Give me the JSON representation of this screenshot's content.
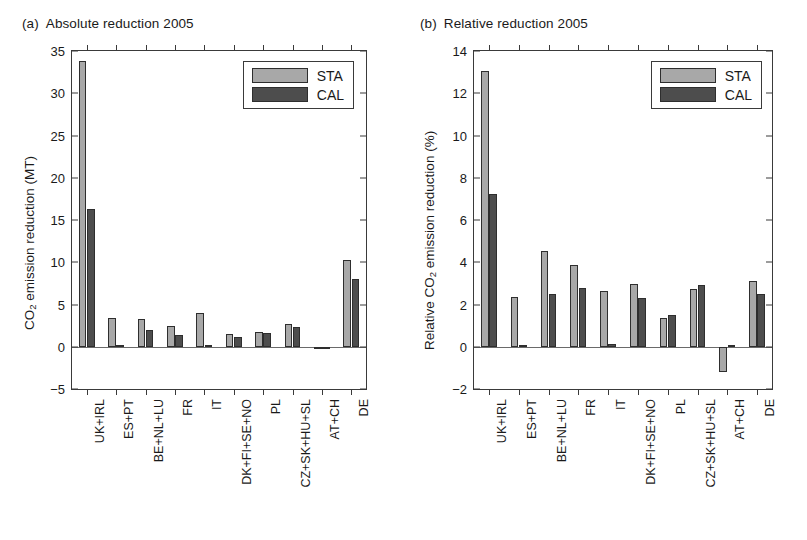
{
  "figure": {
    "panels": [
      {
        "tag": "(a)",
        "title": "Absolute reduction 2005",
        "ylabel_pre": "CO",
        "ylabel_sub": "2",
        "ylabel_post": " emission reduction (MT)",
        "legend": {
          "sta": "STA",
          "cal": "CAL"
        }
      },
      {
        "tag": "(b)",
        "title": "Relative reduction 2005",
        "ylabel_pre": "Relative CO",
        "ylabel_sub": "2",
        "ylabel_post": " emission reduction (%)",
        "legend": {
          "sta": "STA",
          "cal": "CAL"
        }
      }
    ]
  },
  "colors": {
    "sta": "#a8a8a8",
    "cal": "#4d4d4d",
    "axis": "#3a3a3a",
    "background": "#ffffff"
  },
  "chart_data": [
    {
      "type": "bar",
      "panel": "a",
      "title": "Absolute reduction 2005",
      "xlabel": "",
      "ylabel": "CO2 emission reduction (MT)",
      "ylim": [
        -5,
        35
      ],
      "yticks": [
        -5,
        0,
        5,
        10,
        15,
        20,
        25,
        30,
        35
      ],
      "grid": false,
      "legend_position": "top-right",
      "categories": [
        "UK+IRL",
        "ES+PT",
        "BE+NL+LU",
        "FR",
        "IT",
        "DK+FI+SE+NO",
        "PL",
        "CZ+SK+HU+SL",
        "AT+CH",
        "DE"
      ],
      "series": [
        {
          "name": "STA",
          "values": [
            33.8,
            3.4,
            3.3,
            2.4,
            4.0,
            1.5,
            1.7,
            2.7,
            -0.15,
            10.3
          ]
        },
        {
          "name": "CAL",
          "values": [
            16.3,
            0.15,
            2.0,
            1.4,
            0.2,
            1.2,
            1.6,
            2.3,
            -0.1,
            8.0
          ]
        }
      ]
    },
    {
      "type": "bar",
      "panel": "b",
      "title": "Relative reduction 2005",
      "xlabel": "",
      "ylabel": "Relative CO2 emission reduction (%)",
      "ylim": [
        -2,
        14
      ],
      "yticks": [
        -2,
        0,
        2,
        4,
        6,
        8,
        10,
        12,
        14
      ],
      "grid": false,
      "legend_position": "top-right",
      "categories": [
        "UK+IRL",
        "ES+PT",
        "BE+NL+LU",
        "FR",
        "IT",
        "DK+FI+SE+NO",
        "PL",
        "CZ+SK+HU+SL",
        "AT+CH",
        "DE"
      ],
      "series": [
        {
          "name": "STA",
          "values": [
            13.05,
            2.35,
            4.55,
            3.85,
            2.65,
            2.95,
            1.35,
            2.75,
            -1.2,
            3.1
          ]
        },
        {
          "name": "CAL",
          "values": [
            7.25,
            0.1,
            2.5,
            2.8,
            0.15,
            2.3,
            1.5,
            2.9,
            0.08,
            2.5
          ]
        }
      ]
    }
  ]
}
